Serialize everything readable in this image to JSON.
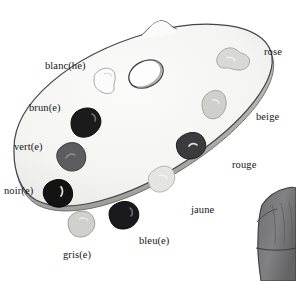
{
  "illustration": {
    "title": "Artist's palette with French colour vocabulary",
    "subject_name": "palette",
    "background_color": "#ffffff",
    "palette": {
      "fill_color": "#f5f5f4",
      "outline_color": "#3a3a3c",
      "shadow_color": "#b9b9b7",
      "thumb_hole_name": "thumb-hole",
      "thumb_notch_name": "thumb-notch"
    },
    "secondary_object": {
      "name": "grey-garment-sleeve",
      "fill_color": "#79797a",
      "outline_color": "#3d3d3f"
    }
  },
  "labels": [
    {
      "id": "blanc",
      "text": "blanc(he)",
      "x": 45,
      "y": 61,
      "side": "left",
      "blob": "blob-blanc"
    },
    {
      "id": "brun",
      "text": "brun(e)",
      "x": 29,
      "y": 103,
      "side": "left",
      "blob": "blob-brun"
    },
    {
      "id": "vert",
      "text": "vert(e)",
      "x": 14,
      "y": 142,
      "side": "left",
      "blob": "blob-vert"
    },
    {
      "id": "noir",
      "text": "noir(e)",
      "x": 4,
      "y": 186,
      "side": "left",
      "blob": "blob-noir"
    },
    {
      "id": "gris",
      "text": "gris(e)",
      "x": 63,
      "y": 250,
      "side": "below",
      "blob": "blob-gris"
    },
    {
      "id": "bleu",
      "text": "bleu(e)",
      "x": 139,
      "y": 236,
      "side": "below",
      "blob": "blob-bleu"
    },
    {
      "id": "jaune",
      "text": "jaune",
      "x": 191,
      "y": 205,
      "side": "right",
      "blob": "blob-jaune"
    },
    {
      "id": "rouge",
      "text": "rouge",
      "x": 232,
      "y": 160,
      "side": "right",
      "blob": "blob-rouge"
    },
    {
      "id": "beige",
      "text": "beige",
      "x": 256,
      "y": 112,
      "side": "right",
      "blob": "blob-beige"
    },
    {
      "id": "rose",
      "text": "rose",
      "x": 264,
      "y": 47,
      "side": "right",
      "blob": "blob-rose"
    }
  ],
  "paint_blobs": [
    {
      "id": "blob-blanc",
      "label_id": "blanc",
      "color": "#fbfbfb",
      "stroke": "#a9a9a7",
      "cx": 108,
      "cy": 79
    },
    {
      "id": "blob-brun",
      "label_id": "brun",
      "color": "#1b1b1c",
      "stroke": "#0d0d0e",
      "cx": 85,
      "cy": 120
    },
    {
      "id": "blob-vert",
      "label_id": "vert",
      "color": "#5d5d5f",
      "stroke": "#3a3a3c",
      "cx": 69,
      "cy": 155
    },
    {
      "id": "blob-noir",
      "label_id": "noir",
      "color": "#131314",
      "stroke": "#060607",
      "cx": 56,
      "cy": 192
    },
    {
      "id": "blob-gris",
      "label_id": "gris",
      "color": "#d0d0cd",
      "stroke": "#a0a09d",
      "cx": 82,
      "cy": 222
    },
    {
      "id": "blob-bleu",
      "label_id": "bleu",
      "color": "#1a1a1c",
      "stroke": "#0a0a0b",
      "cx": 124,
      "cy": 213
    },
    {
      "id": "blob-jaune",
      "label_id": "jaune",
      "color": "#e4e4e1",
      "stroke": "#b6b6b3",
      "cx": 162,
      "cy": 177
    },
    {
      "id": "blob-rouge",
      "label_id": "rouge",
      "color": "#3b3b3d",
      "stroke": "#202022",
      "cx": 192,
      "cy": 144
    },
    {
      "id": "blob-beige",
      "label_id": "beige",
      "color": "#cfcfcb",
      "stroke": "#a3a39f",
      "cx": 215,
      "cy": 104
    },
    {
      "id": "blob-rose",
      "label_id": "rose",
      "color": "#d8d8d5",
      "stroke": "#a8a8a4",
      "cx": 231,
      "cy": 58
    }
  ]
}
